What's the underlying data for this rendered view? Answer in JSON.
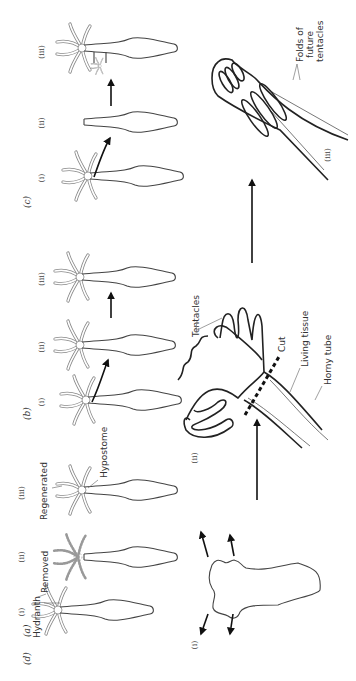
{
  "figure": {
    "orientation": "rotated 90deg counter-clockwise",
    "panels": [
      {
        "id": "a",
        "label": "(a)",
        "stages": [
          {
            "label": "(i)",
            "annotation": "Hydranth"
          },
          {
            "label": "(ii)",
            "annotation": "Removed"
          },
          {
            "label": "(iii)",
            "annotation": "Regenerated",
            "annotation2": "Hypostome"
          }
        ]
      },
      {
        "id": "b",
        "label": "(b)",
        "stages": [
          {
            "label": "(i)"
          },
          {
            "label": "(ii)"
          },
          {
            "label": "(iii)"
          }
        ]
      },
      {
        "id": "c",
        "label": "(c)",
        "stages": [
          {
            "label": "(i)"
          },
          {
            "label": "(ii)"
          },
          {
            "label": "(iii)"
          }
        ]
      },
      {
        "id": "d",
        "label": "(d)",
        "stages": [
          {
            "label": "(i)"
          },
          {
            "label": "(ii)",
            "annotations": [
              "Tentacles",
              "Cut",
              "Living tissue",
              "Horny tube"
            ]
          },
          {
            "label": "(iii)",
            "annotations": [
              "Folds of",
              "future",
              "tentacles"
            ]
          }
        ]
      }
    ]
  },
  "colors": {
    "line": "#222222",
    "tentacle": "#888888",
    "background": "#ffffff"
  }
}
